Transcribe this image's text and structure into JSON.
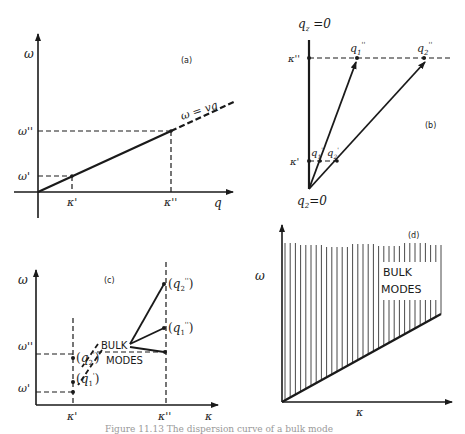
{
  "figure": {
    "panel_a": {
      "tag": "(a)",
      "y_axis": "ω",
      "x_axis": "q",
      "line_label": "ω = vq",
      "y_ticks": [
        "ω''",
        "ω'"
      ],
      "x_ticks": [
        "κ'",
        "κ''"
      ]
    },
    "panel_b": {
      "tag": "(b)",
      "top_label": "q_z = 0",
      "bottom_label": "q_2 = 0",
      "y_ticks": [
        "κ''",
        "κ'"
      ],
      "points": [
        "q''_1",
        "q''_2",
        "q'_1",
        "q'_2"
      ]
    },
    "panel_c": {
      "tag": "(c)",
      "y_axis": "ω",
      "x_axis": "κ",
      "y_ticks": [
        "ω''",
        "ω'"
      ],
      "x_ticks": [
        "κ'",
        "κ''"
      ],
      "points": [
        "(q''_2)",
        "(q''_1)",
        "(q'_2)",
        "(q'_1)"
      ],
      "annotation_line1": "BULK",
      "annotation_line2": "MODES"
    },
    "panel_d": {
      "tag": "(d)",
      "y_axis": "ω",
      "x_axis": "κ",
      "annotation_line1": "BULK",
      "annotation_line2": "MODES"
    },
    "caption": "Figure 11.13 The dispersion curve of a bulk mode"
  }
}
